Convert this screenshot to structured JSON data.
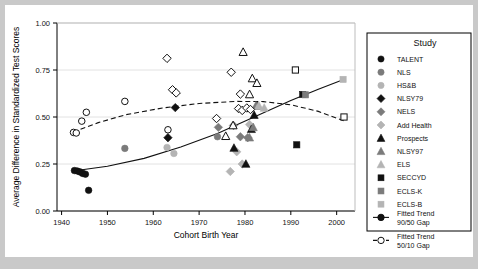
{
  "chart_data": {
    "type": "scatter",
    "title": "",
    "xlabel": "Cohort Birth Year",
    "ylabel": "Average Difference in Standardized Test Scores",
    "xlim": [
      1939,
      2004
    ],
    "ylim": [
      0.0,
      1.0
    ],
    "xticks": [
      1940,
      1950,
      1960,
      1970,
      1980,
      1990,
      2000
    ],
    "xtick_labels": [
      "1940",
      "1950",
      "1960",
      "1970",
      "1980",
      "1990",
      "2000"
    ],
    "yticks": [
      0.0,
      0.25,
      0.5,
      0.75,
      1.0
    ],
    "ytick_labels": [
      "0.00",
      "0.25",
      "0.50",
      "0.75",
      "1.00"
    ],
    "grid": true,
    "legend_position": "right",
    "legend_title": "Study",
    "colors": {
      "dark": "#111111",
      "medium": "#7b7b7b",
      "light": "#b4b4b4",
      "background": "#c9c9c9",
      "panel": "#ffffff",
      "grid": "#e2e2e2"
    },
    "series": [
      {
        "name": "TALENT",
        "marker": "circle",
        "fill": "dark",
        "outline": false,
        "points": [
          [
            1942.8,
            0.215
          ],
          [
            1943.4,
            0.213
          ],
          [
            1944.0,
            0.208
          ],
          [
            1944.6,
            0.2
          ],
          [
            1945.2,
            0.196
          ],
          [
            1945.9,
            0.11
          ]
        ]
      },
      {
        "name": "NLS",
        "marker": "circle",
        "fill": "medium",
        "outline": false,
        "points": [
          [
            1953.8,
            0.333
          ],
          [
            1974.0,
            0.395
          ]
        ]
      },
      {
        "name": "HS&B",
        "marker": "circle",
        "fill": "light",
        "outline": false,
        "points": [
          [
            1963.0,
            0.338
          ],
          [
            1964.5,
            0.306
          ]
        ]
      },
      {
        "name": "NLSY79",
        "marker": "diamond",
        "fill": "dark",
        "outline": false,
        "points": [
          [
            1963.2,
            0.39
          ],
          [
            1964.8,
            0.55
          ]
        ]
      },
      {
        "name": "NELS",
        "marker": "diamond",
        "fill": "medium",
        "outline": false,
        "points": [
          [
            1974.2,
            0.445
          ],
          [
            1977.5,
            0.455
          ],
          [
            1979.0,
            0.395
          ],
          [
            1980.6,
            0.39
          ]
        ]
      },
      {
        "name": "Add Health",
        "marker": "diamond",
        "fill": "light",
        "outline": false,
        "points": [
          [
            1976.8,
            0.21
          ],
          [
            1978.2,
            0.315
          ],
          [
            1979.4,
            0.25
          ],
          [
            1981.0,
            0.46
          ]
        ]
      },
      {
        "name": "Prospects",
        "marker": "triangle",
        "fill": "dark",
        "outline": false,
        "points": [
          [
            1977.6,
            0.335
          ],
          [
            1980.2,
            0.25
          ],
          [
            1981.4,
            0.435
          ],
          [
            1982.0,
            0.51
          ],
          [
            1982.6,
            0.56
          ]
        ]
      },
      {
        "name": "NLSY97",
        "marker": "triangle",
        "fill": "medium",
        "outline": false,
        "points": [
          [
            1981.0,
            0.39
          ],
          [
            1981.8,
            0.445
          ],
          [
            1982.4,
            0.56
          ]
        ]
      },
      {
        "name": "ELS",
        "marker": "triangle",
        "fill": "light",
        "outline": false,
        "points": [
          [
            1983.0,
            0.56
          ],
          [
            1984.2,
            0.548
          ]
        ]
      },
      {
        "name": "SECCYD",
        "marker": "square",
        "fill": "dark",
        "outline": false,
        "points": [
          [
            1991.3,
            0.352
          ],
          [
            1992.6,
            0.62
          ]
        ]
      },
      {
        "name": "ECLS-K",
        "marker": "square",
        "fill": "medium",
        "outline": false,
        "points": [
          [
            1993.2,
            0.618
          ]
        ]
      },
      {
        "name": "ECLS-B",
        "marker": "square",
        "fill": "light",
        "outline": false,
        "points": [
          [
            2001.4,
            0.7
          ]
        ]
      },
      {
        "name": "Open diamonds 50/10",
        "marker": "diamond",
        "fill": "none",
        "outline": true,
        "points": [
          [
            1963.0,
            0.812
          ],
          [
            1964.2,
            0.645
          ],
          [
            1965.0,
            0.628
          ],
          [
            1973.8,
            0.492
          ],
          [
            1978.6,
            0.545
          ],
          [
            1979.4,
            0.535
          ],
          [
            1980.4,
            0.548
          ],
          [
            1981.2,
            0.54
          ],
          [
            1977.0,
            0.738
          ],
          [
            1979.0,
            0.622
          ]
        ]
      },
      {
        "name": "Open triangles 50/10",
        "marker": "triangle",
        "fill": "none",
        "outline": true,
        "points": [
          [
            1979.6,
            0.845
          ],
          [
            1981.6,
            0.705
          ],
          [
            1982.6,
            0.68
          ],
          [
            1981.0,
            0.62
          ],
          [
            1977.4,
            0.455
          ],
          [
            1975.8,
            0.398
          ]
        ]
      },
      {
        "name": "Open squares 50/10",
        "marker": "square",
        "fill": "none",
        "outline": true,
        "points": [
          [
            1991.0,
            0.75
          ],
          [
            2001.6,
            0.5
          ]
        ]
      },
      {
        "name": "Open circles 50/10",
        "marker": "circle",
        "fill": "none",
        "outline": true,
        "points": [
          [
            1942.6,
            0.418
          ],
          [
            1943.2,
            0.415
          ],
          [
            1944.4,
            0.478
          ],
          [
            1945.4,
            0.525
          ],
          [
            1953.8,
            0.583
          ],
          [
            1963.2,
            0.432
          ]
        ]
      }
    ],
    "trend_lines": [
      {
        "name": "Fitted Trend 90/50 Gap",
        "style": "solid",
        "points": [
          [
            1942.5,
            0.213
          ],
          [
            1950,
            0.238
          ],
          [
            1958,
            0.28
          ],
          [
            1966,
            0.34
          ],
          [
            1974,
            0.412
          ],
          [
            1982,
            0.5
          ],
          [
            1990,
            0.588
          ],
          [
            1996,
            0.648
          ],
          [
            2001.8,
            0.702
          ]
        ]
      },
      {
        "name": "Fitted Trend 50/10 Gap",
        "style": "dashed",
        "points": [
          [
            1942.5,
            0.42
          ],
          [
            1948,
            0.47
          ],
          [
            1954,
            0.512
          ],
          [
            1962,
            0.548
          ],
          [
            1970,
            0.572
          ],
          [
            1978,
            0.583
          ],
          [
            1984,
            0.582
          ],
          [
            1990,
            0.565
          ],
          [
            1996,
            0.53
          ],
          [
            2001.8,
            0.478
          ]
        ]
      }
    ],
    "legend_entries": [
      {
        "label": "TALENT",
        "marker": "circle",
        "fill": "dark",
        "outline": false
      },
      {
        "label": "NLS",
        "marker": "circle",
        "fill": "medium",
        "outline": false
      },
      {
        "label": "HS&B",
        "marker": "circle",
        "fill": "light",
        "outline": false
      },
      {
        "label": "NLSY79",
        "marker": "diamond",
        "fill": "dark",
        "outline": false
      },
      {
        "label": "NELS",
        "marker": "diamond",
        "fill": "medium",
        "outline": false
      },
      {
        "label": "Add Health",
        "marker": "diamond",
        "fill": "light",
        "outline": false
      },
      {
        "label": "Prospects",
        "marker": "triangle",
        "fill": "dark",
        "outline": false
      },
      {
        "label": "NLSY97",
        "marker": "triangle",
        "fill": "medium",
        "outline": false
      },
      {
        "label": "ELS",
        "marker": "triangle",
        "fill": "light",
        "outline": false
      },
      {
        "label": "SECCYD",
        "marker": "square",
        "fill": "dark",
        "outline": false
      },
      {
        "label": "ECLS-K",
        "marker": "square",
        "fill": "medium",
        "outline": false
      },
      {
        "label": "ECLS-B",
        "marker": "square",
        "fill": "light",
        "outline": false
      },
      {
        "label": "Fitted Trend\n90/50 Gap",
        "marker": "line-circle-filled",
        "fill": "dark",
        "outline": false
      },
      {
        "label": "Fitted Trend\n50/10 Gap",
        "marker": "line-circle-open",
        "fill": "none",
        "outline": true
      }
    ]
  }
}
